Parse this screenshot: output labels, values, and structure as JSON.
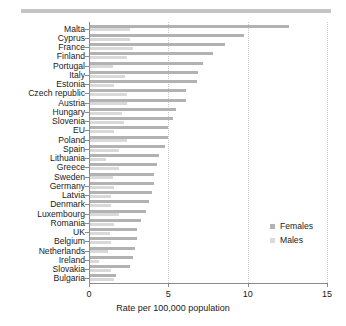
{
  "figure": {
    "top_rule_color": "#c4c4c4"
  },
  "legend": {
    "position": "right-middle",
    "entries": [
      {
        "label": "Females",
        "color": "#b2b2b2"
      },
      {
        "label": "Males",
        "color": "#d9d9d9"
      }
    ]
  },
  "chart_data": {
    "type": "bar",
    "orientation": "horizontal",
    "title": "",
    "subtitle": "",
    "xlabel": "Rate per 100,000 population",
    "ylabel": "",
    "xlim": [
      0,
      15
    ],
    "xticks": [
      0,
      5,
      10,
      15
    ],
    "xtick_labels": [
      "0",
      "5",
      "10",
      "15"
    ],
    "grid": "vertical-dotted",
    "categories": [
      "Malta",
      "Cyprus",
      "France",
      "Finland",
      "Portugal",
      "Italy",
      "Estonia",
      "Czech republic",
      "Austria",
      "Hungary",
      "Slovenia",
      "EU",
      "Poland",
      "Spain",
      "Lithuania",
      "Greece",
      "Sweden",
      "Germany",
      "Latvia",
      "Denmark",
      "Luxembourg",
      "Romania",
      "UK",
      "Belgium",
      "Netherlands",
      "Ireland",
      "Slovakia",
      "Bulgaria"
    ],
    "series": [
      {
        "name": "Females",
        "color": "#b2b2b2",
        "values": [
          12.6,
          9.8,
          8.6,
          7.8,
          7.2,
          6.9,
          6.8,
          6.1,
          6.1,
          5.5,
          5.3,
          5.0,
          5.0,
          4.8,
          4.4,
          4.3,
          4.1,
          4.1,
          4.0,
          3.8,
          3.6,
          3.3,
          3.0,
          3.0,
          2.9,
          2.8,
          2.6,
          1.7
        ]
      },
      {
        "name": "Males",
        "color": "#d9d9d9",
        "values": [
          2.6,
          2.6,
          2.8,
          2.4,
          1.5,
          2.3,
          1.6,
          2.4,
          2.4,
          2.1,
          2.2,
          1.6,
          2.4,
          1.9,
          1.1,
          1.9,
          1.5,
          1.6,
          1.4,
          1.4,
          1.9,
          1.6,
          1.3,
          1.4,
          1.2,
          0.6,
          1.4,
          1.6
        ]
      }
    ]
  }
}
